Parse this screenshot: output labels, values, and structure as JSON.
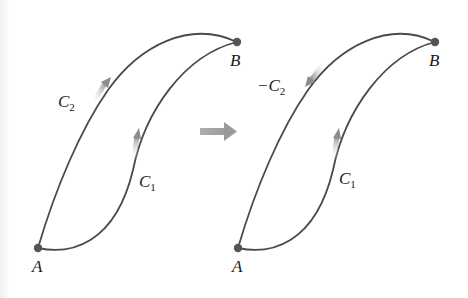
{
  "figure": {
    "colors": {
      "curve": "#4a4a4a",
      "point": "#555555",
      "arrow_fill": "#9a9a9a",
      "transition_arrow": "#a0a0a0",
      "background": "#ffffff"
    },
    "left_panel": {
      "point_start": "A",
      "point_end": "B",
      "curve_outer": {
        "label": "C",
        "subscript": "2",
        "direction": "A-to-B"
      },
      "curve_inner": {
        "label": "C",
        "subscript": "1",
        "direction": "A-to-B"
      }
    },
    "transition_arrow": {
      "icon": "right-arrow-icon"
    },
    "right_panel": {
      "point_start": "A",
      "point_end": "B",
      "curve_outer": {
        "label": "−C",
        "subscript": "2",
        "direction": "B-to-A"
      },
      "curve_inner": {
        "label": "C",
        "subscript": "1",
        "direction": "A-to-B"
      }
    }
  }
}
